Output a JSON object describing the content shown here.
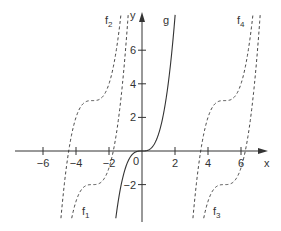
{
  "chart_data": {
    "type": "line",
    "title": "",
    "xlabel": "x",
    "ylabel": "y",
    "xlim": [
      -8.3,
      7.9
    ],
    "ylim": [
      -4.0,
      8.1
    ],
    "grid": false,
    "legend": "inline labels",
    "x_ticks": [
      -6,
      -4,
      -2,
      2,
      4,
      6
    ],
    "x_tick_labels": [
      "−6",
      "−4",
      "−2",
      "2",
      "4",
      "6"
    ],
    "y_ticks": [
      -2,
      2,
      4,
      6
    ],
    "y_tick_labels": [
      "−2",
      "2",
      "4",
      "6"
    ],
    "origin_label": "0",
    "series": [
      {
        "name": "g",
        "label": "g",
        "sub": "",
        "formula": "x^3",
        "shift_x": 0,
        "shift_y": 0,
        "style": "solid",
        "label_pos": [
          163,
          24
        ]
      },
      {
        "name": "f1",
        "label": "f",
        "sub": "1",
        "formula": "(x+3)^3 - 2",
        "shift_x": -3,
        "shift_y": -2,
        "style": "dashed",
        "label_pos": [
          82,
          215
        ]
      },
      {
        "name": "f2",
        "label": "f",
        "sub": "2",
        "formula": "(x+3)^3 + 3",
        "shift_x": -3,
        "shift_y": 3,
        "style": "dashed",
        "label_pos": [
          105,
          24
        ]
      },
      {
        "name": "f3",
        "label": "f",
        "sub": "3",
        "formula": "(x-5)^3 - 2",
        "shift_x": 5,
        "shift_y": -2,
        "style": "dashed",
        "label_pos": [
          213,
          215
        ]
      },
      {
        "name": "f4",
        "label": "f",
        "sub": "4",
        "formula": "(x-5)^3 + 3",
        "shift_x": 5,
        "shift_y": 3,
        "style": "dashed",
        "label_pos": [
          237,
          24
        ]
      }
    ],
    "colors": {
      "axis": "#333333",
      "curve": "#333333"
    }
  },
  "layout": {
    "origin_px": [
      142,
      151
    ],
    "unit_x_px": 16.5,
    "unit_y_px": 16.8,
    "plot_top_px": 15,
    "plot_bottom_px": 218
  }
}
